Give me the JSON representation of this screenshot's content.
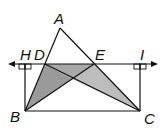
{
  "diagram": {
    "labels": {
      "A": "A",
      "B": "B",
      "C": "C",
      "D": "D",
      "E": "E",
      "H": "H",
      "I": "I"
    },
    "colors": {
      "stroke": "#111111",
      "dark_shade": "#9a9a9a",
      "light_shade": "#bdbdbd",
      "background": "#ffffff"
    }
  }
}
